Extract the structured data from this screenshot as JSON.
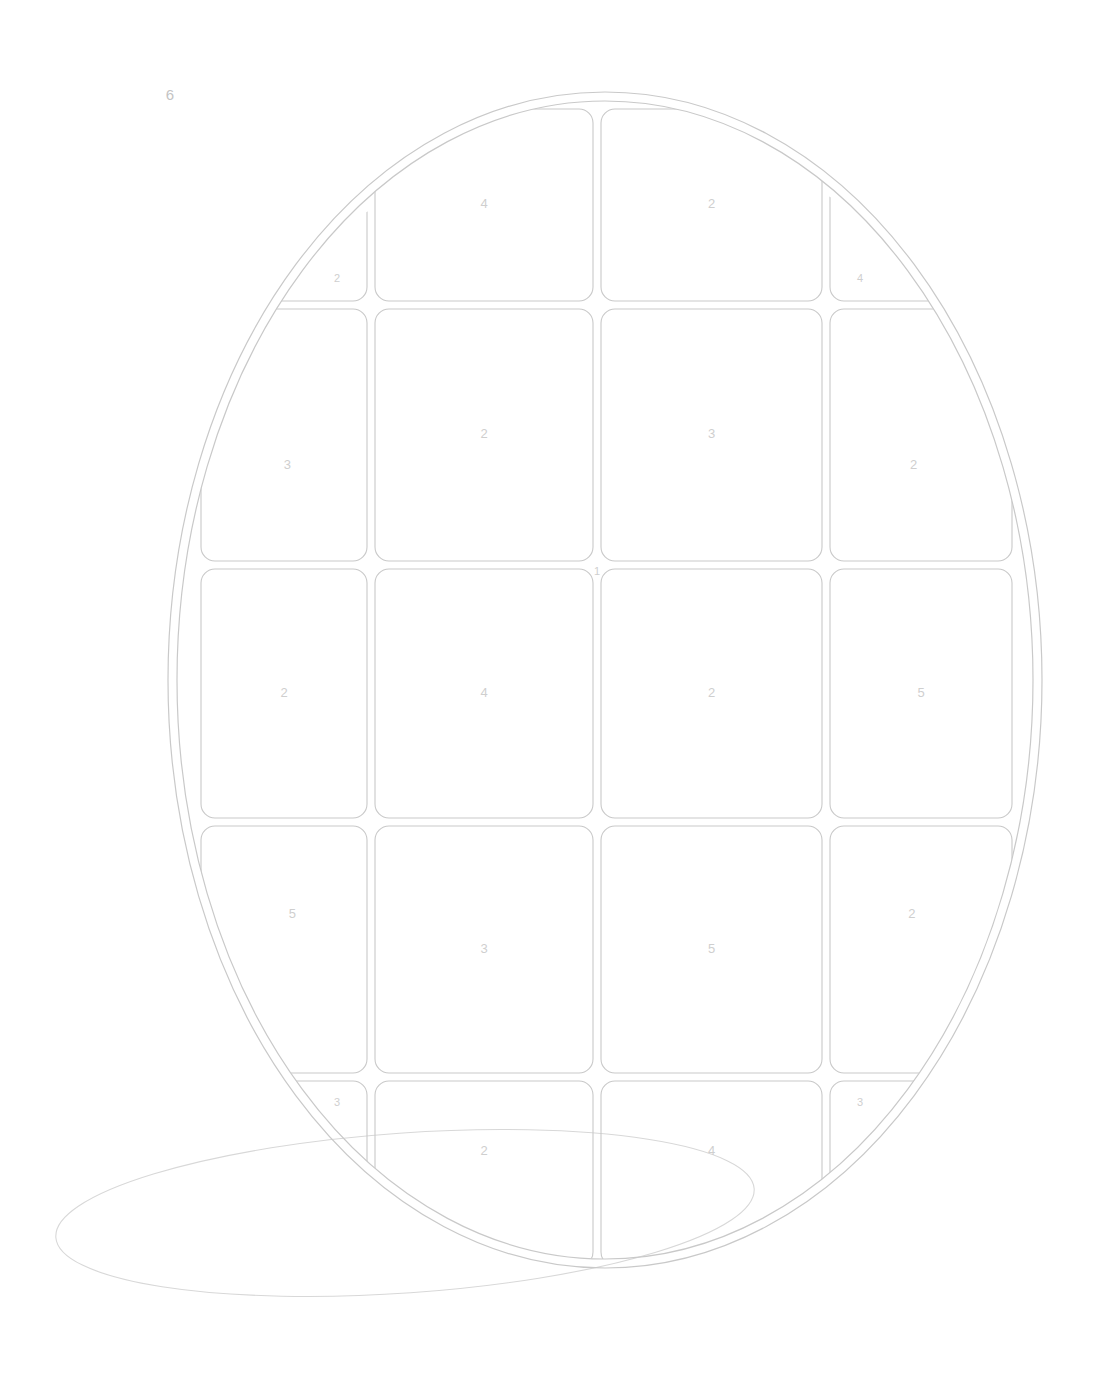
{
  "page": {
    "background_color": "#ffffff",
    "line_color": "#c9c9c9",
    "shadow_line_color": "#d8d8d8",
    "label_color": "#cfcfcf",
    "corner_label_color": "#c4c4c4"
  },
  "annotations": {
    "top_left_number": "6",
    "center_marker": "1"
  },
  "wafer": {
    "shape": "ellipse",
    "center_x": 605,
    "center_y": 680,
    "radius_x": 437,
    "radius_y": 588,
    "inner_inset": 9
  },
  "shadow": {
    "center_x": 405,
    "center_y": 1213,
    "radius_x": 350,
    "radius_y": 80,
    "rotation_deg": -4
  },
  "grid": {
    "columns": 4,
    "rows": 5,
    "column_x": [
      197,
      371,
      597,
      826,
      1016
    ],
    "row_y": [
      105,
      305,
      565,
      822,
      1077,
      1270
    ],
    "gap": 8,
    "corner_radius": 14
  },
  "dies": [
    {
      "row": 0,
      "col": 0,
      "label": "2",
      "kind": "corner-triangle-tl"
    },
    {
      "row": 0,
      "col": 1,
      "label": "4",
      "kind": "clipped"
    },
    {
      "row": 0,
      "col": 2,
      "label": "2",
      "kind": "clipped"
    },
    {
      "row": 0,
      "col": 3,
      "label": "4",
      "kind": "corner-triangle-tr"
    },
    {
      "row": 1,
      "col": 0,
      "label": "3",
      "kind": "clipped"
    },
    {
      "row": 1,
      "col": 1,
      "label": "2",
      "kind": "full"
    },
    {
      "row": 1,
      "col": 2,
      "label": "3",
      "kind": "full"
    },
    {
      "row": 1,
      "col": 3,
      "label": "2",
      "kind": "clipped"
    },
    {
      "row": 2,
      "col": 0,
      "label": "2",
      "kind": "clipped"
    },
    {
      "row": 2,
      "col": 1,
      "label": "4",
      "kind": "full"
    },
    {
      "row": 2,
      "col": 2,
      "label": "2",
      "kind": "full"
    },
    {
      "row": 2,
      "col": 3,
      "label": "5",
      "kind": "clipped"
    },
    {
      "row": 3,
      "col": 0,
      "label": "5",
      "kind": "clipped"
    },
    {
      "row": 3,
      "col": 1,
      "label": "3",
      "kind": "full"
    },
    {
      "row": 3,
      "col": 2,
      "label": "5",
      "kind": "full"
    },
    {
      "row": 3,
      "col": 3,
      "label": "2",
      "kind": "clipped"
    },
    {
      "row": 4,
      "col": 0,
      "label": "3",
      "kind": "corner-triangle-bl"
    },
    {
      "row": 4,
      "col": 1,
      "label": "2",
      "kind": "clipped"
    },
    {
      "row": 4,
      "col": 2,
      "label": "4",
      "kind": "clipped"
    },
    {
      "row": 4,
      "col": 3,
      "label": "3",
      "kind": "corner-triangle-br"
    }
  ],
  "legend": {
    "label_values": [
      "1",
      "2",
      "3",
      "4",
      "5",
      "6"
    ]
  }
}
